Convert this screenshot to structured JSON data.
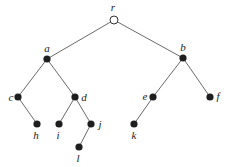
{
  "diagram": {
    "type": "rooted-tree",
    "root": "r",
    "nodes": [
      {
        "id": "r",
        "label": "r",
        "x": 114,
        "y": 20,
        "hollow": true,
        "lx": 113,
        "ly": 11,
        "anchor": "middle"
      },
      {
        "id": "a",
        "label": "a",
        "x": 47,
        "y": 59,
        "hollow": false,
        "lx": 47,
        "ly": 52,
        "anchor": "middle"
      },
      {
        "id": "b",
        "label": "b",
        "x": 183,
        "y": 58,
        "hollow": false,
        "lx": 183,
        "ly": 51,
        "anchor": "middle"
      },
      {
        "id": "c",
        "label": "c",
        "x": 18,
        "y": 97,
        "hollow": false,
        "lx": 11,
        "ly": 101,
        "anchor": "middle"
      },
      {
        "id": "d",
        "label": "d",
        "x": 75,
        "y": 97,
        "hollow": false,
        "lx": 84,
        "ly": 101,
        "anchor": "middle"
      },
      {
        "id": "e",
        "label": "e",
        "x": 153,
        "y": 97,
        "hollow": false,
        "lx": 145,
        "ly": 100,
        "anchor": "middle"
      },
      {
        "id": "f",
        "label": "f",
        "x": 210,
        "y": 97,
        "hollow": false,
        "lx": 218,
        "ly": 100,
        "anchor": "middle"
      },
      {
        "id": "h",
        "label": "h",
        "x": 37,
        "y": 124,
        "hollow": false,
        "lx": 36,
        "ly": 139,
        "anchor": "middle"
      },
      {
        "id": "i",
        "label": "i",
        "x": 59,
        "y": 124,
        "hollow": false,
        "lx": 58,
        "ly": 139,
        "anchor": "middle"
      },
      {
        "id": "j",
        "label": "j",
        "x": 91,
        "y": 124,
        "hollow": false,
        "lx": 100,
        "ly": 128,
        "anchor": "middle"
      },
      {
        "id": "k",
        "label": "k",
        "x": 134,
        "y": 124,
        "hollow": false,
        "lx": 134,
        "ly": 139,
        "anchor": "middle"
      },
      {
        "id": "l",
        "label": "l",
        "x": 79,
        "y": 147,
        "hollow": false,
        "lx": 78,
        "ly": 162,
        "anchor": "middle"
      }
    ],
    "edges": [
      [
        "r",
        "a"
      ],
      [
        "r",
        "b"
      ],
      [
        "a",
        "c"
      ],
      [
        "a",
        "d"
      ],
      [
        "b",
        "e"
      ],
      [
        "b",
        "f"
      ],
      [
        "c",
        "h"
      ],
      [
        "d",
        "i"
      ],
      [
        "d",
        "j"
      ],
      [
        "j",
        "l"
      ],
      [
        "e",
        "k"
      ]
    ]
  }
}
